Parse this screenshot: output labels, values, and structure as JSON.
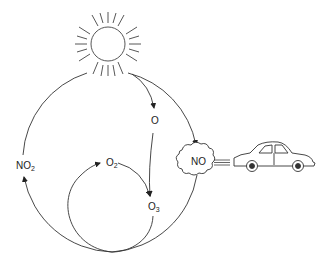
{
  "diagram": {
    "type": "photochemical-smog-cycle",
    "nodes": {
      "sun": {
        "icon": "sun-icon"
      },
      "o": {
        "label": "O"
      },
      "o2": {
        "base": "O",
        "sub": "2"
      },
      "o3": {
        "base": "O",
        "sub": "3"
      },
      "no2": {
        "base": "NO",
        "sub": "2"
      },
      "no": {
        "label": "NO"
      },
      "car": {
        "icon": "car-icon"
      },
      "cloud": {
        "icon": "exhaust-cloud-icon"
      }
    },
    "edges": [
      {
        "from": "sun",
        "to": "o"
      },
      {
        "from": "o",
        "to": "o3"
      },
      {
        "from": "o2",
        "to": "o3"
      },
      {
        "from": "no",
        "to": "no2"
      },
      {
        "from": "no2",
        "to": "sun"
      },
      {
        "from": "car",
        "to": "no"
      }
    ],
    "colors": {
      "stroke": "#333333",
      "background": "#ffffff"
    }
  }
}
